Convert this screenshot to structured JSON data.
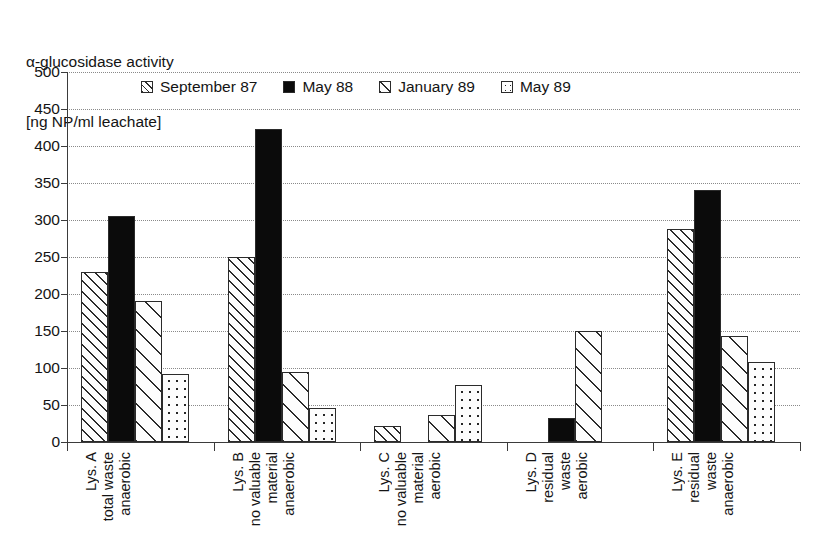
{
  "chart_data": {
    "type": "bar",
    "title": "α-glucosidase activity [ng NP/ml leachate]",
    "title_lines": [
      "α-glucosidase activity",
      "[ng NP/ml leachate]"
    ],
    "xlabel": "",
    "ylabel": "α-glucosidase activity [ng NP/ml leachate]",
    "ylim": [
      0,
      500
    ],
    "ytick_step": 50,
    "yticks": [
      500,
      450,
      400,
      350,
      300,
      250,
      200,
      150,
      100,
      50,
      0
    ],
    "ytick_labels": [
      "500",
      "450",
      "400",
      "350",
      "300",
      "250",
      "200",
      "150",
      "100",
      "50",
      "0"
    ],
    "grid": true,
    "grid_style": "dotted-horizontal",
    "legend_position": "top-inside",
    "categories": [
      "Lys. A total waste anaerobic",
      "Lys. B no valuable material anaerobic",
      "Lys. C no valuable material aerobic",
      "Lys. D residual waste aerobic",
      "Lys. E residual waste anaerobic"
    ],
    "category_lines": [
      [
        "Lys. A",
        "total waste",
        "anaerobic"
      ],
      [
        "Lys. B",
        "no valuable",
        "material",
        "anaerobic"
      ],
      [
        "Lys. C",
        "no valuable",
        "material",
        "aerobic"
      ],
      [
        "Lys. D",
        "residual",
        "waste",
        "aerobic"
      ],
      [
        "Lys. E",
        "residual",
        "waste",
        "anaerobic"
      ]
    ],
    "series": [
      {
        "name": "September 87",
        "pattern": "diagonal-hatch-dense",
        "values": [
          230,
          250,
          22,
          0,
          288
        ]
      },
      {
        "name": "May 88",
        "pattern": "solid-black",
        "values": [
          305,
          423,
          0,
          32,
          340
        ]
      },
      {
        "name": "January 89",
        "pattern": "diagonal-hatch-sparse",
        "values": [
          190,
          95,
          37,
          150,
          143
        ]
      },
      {
        "name": "May 89",
        "pattern": "dotted",
        "values": [
          92,
          46,
          77,
          0,
          108
        ]
      }
    ]
  },
  "colors": {
    "axis": "#3b3b3b",
    "grid": "#8a8a8a",
    "bar_outline": "#2b2b2b",
    "solid_fill": "#0b0b0b",
    "background": "#ffffff",
    "text": "#141414"
  }
}
